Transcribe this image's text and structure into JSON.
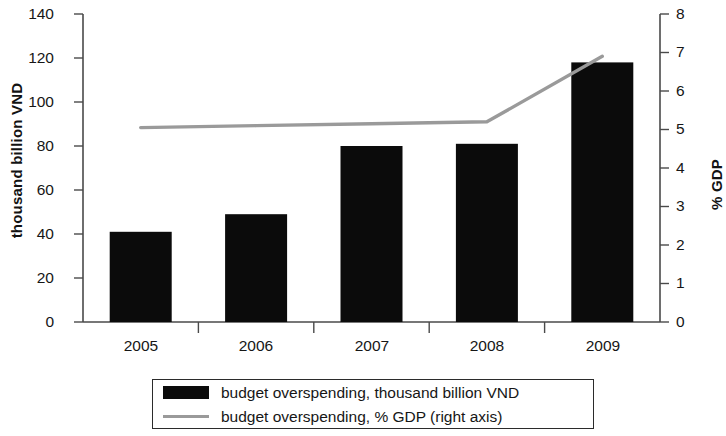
{
  "chart_data": {
    "type": "bar",
    "title": "",
    "xlabel": "",
    "ylabel": "thousand billion VND",
    "ylabel_right": "% GDP",
    "categories": [
      "2005",
      "2006",
      "2007",
      "2008",
      "2009"
    ],
    "ylim": [
      0,
      140
    ],
    "yticks": [
      0,
      20,
      40,
      60,
      80,
      100,
      120,
      140
    ],
    "ylim_right": [
      0,
      8
    ],
    "yticks_right": [
      0,
      1,
      2,
      3,
      4,
      5,
      6,
      7,
      8
    ],
    "grid": false,
    "legend_position": "bottom",
    "series": [
      {
        "name": "budget overspending, thousand billion VND",
        "type": "bar",
        "axis": "left",
        "color": "#0b0b0b",
        "values": [
          41,
          49,
          80,
          81,
          118
        ]
      },
      {
        "name": "budget overspending, % GDP  (right axis)",
        "type": "line",
        "axis": "right",
        "color": "#9a9a9a",
        "values": [
          5.05,
          5.1,
          5.15,
          5.2,
          6.9
        ]
      }
    ]
  },
  "axes": {
    "left_title": "thousand billion VND",
    "right_title": "% GDP",
    "left_ticks": [
      "140",
      "120",
      "100",
      "80",
      "60",
      "40",
      "20",
      "0"
    ],
    "right_ticks": [
      "8",
      "7",
      "6",
      "5",
      "4",
      "3",
      "2",
      "1",
      "0"
    ],
    "category_labels": [
      "2005",
      "2006",
      "2007",
      "2008",
      "2009"
    ]
  },
  "legend": {
    "items": [
      {
        "label": "budget overspending, thousand billion VND",
        "marker": "bar-swatch-icon",
        "color": "#0b0b0b"
      },
      {
        "label": "budget overspending, % GDP  (right axis)",
        "marker": "line-swatch-icon",
        "color": "#9a9a9a"
      }
    ]
  }
}
